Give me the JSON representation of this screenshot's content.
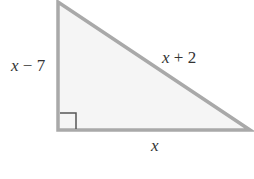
{
  "figure": {
    "type": "right-triangle",
    "vertices": {
      "top": [
        58,
        2
      ],
      "right_angle": [
        58,
        130
      ],
      "right": [
        250,
        130
      ]
    },
    "colors": {
      "stroke": "#a9a9a9",
      "fill": "#f5f5f5",
      "right_angle_marker": "#555555",
      "label": "#333333"
    },
    "labels": {
      "vertical_leg": {
        "var": "x",
        "op": " − ",
        "num": "7"
      },
      "hypotenuse": {
        "var": "x",
        "op": " + ",
        "num": "2"
      },
      "horizontal_leg": {
        "var": "x"
      }
    },
    "right_angle_marker": true
  }
}
